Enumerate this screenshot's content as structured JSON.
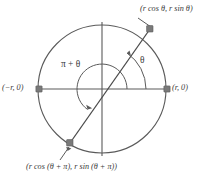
{
  "figure": {
    "type": "geometry-diagram",
    "colors": {
      "stroke": "#5a5a5a",
      "ray_stroke": "#4a4a4a",
      "marker_fill": "#7a7a7a",
      "text": "#3a3a3a",
      "background": "#ffffff"
    },
    "labels": {
      "point_top_right": "(r cos θ, r sin θ)",
      "point_bottom_left": "(r cos (θ + π), r sin (θ + π))",
      "point_left": "(−r, 0)",
      "point_right": "(r, 0)",
      "angle_theta": "θ",
      "angle_pi_plus_theta": "π + θ"
    },
    "geometry": {
      "center": {
        "x": 102,
        "y": 89
      },
      "radius": 64,
      "theta_degrees": 55,
      "points": [
        {
          "name": "terminal-point",
          "x": 150,
          "y": 29,
          "label": "(r cos θ, r sin θ)"
        },
        {
          "name": "antipodal-point",
          "x": 70,
          "y": 143,
          "label": "(r cos (θ + π), r sin (θ + π))"
        },
        {
          "name": "left-point",
          "x": 39,
          "y": 89,
          "label": "(−r, 0)"
        },
        {
          "name": "right-point",
          "x": 167,
          "y": 89,
          "label": "(r, 0)"
        }
      ],
      "arcs": [
        {
          "name": "theta-arc",
          "radius": 44,
          "start_degrees": 0,
          "end_degrees": 55
        },
        {
          "name": "pi-plus-theta-arc",
          "radius": 25,
          "start_degrees": 0,
          "end_degrees": 235
        }
      ]
    }
  }
}
